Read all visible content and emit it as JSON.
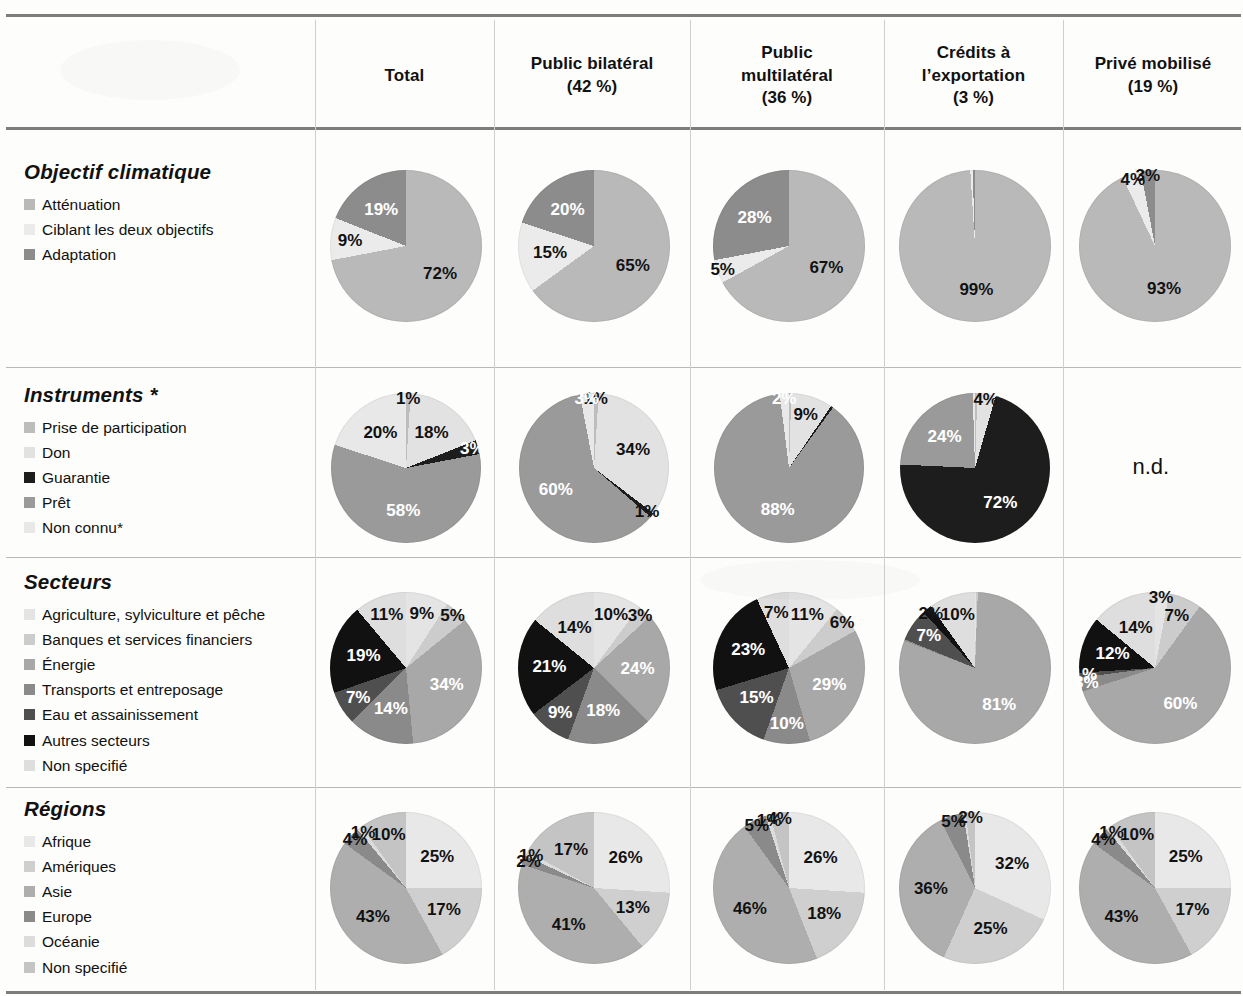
{
  "table": {
    "columns": [
      {
        "id": "rowhead",
        "lines": []
      },
      {
        "id": "total",
        "lines": [
          "Total"
        ]
      },
      {
        "id": "public_bilateral",
        "lines": [
          "Public bilatéral",
          "(42 %)"
        ]
      },
      {
        "id": "public_multilateral",
        "lines": [
          "Public",
          "multilatéral",
          "(36 %)"
        ]
      },
      {
        "id": "credits_export",
        "lines": [
          "Crédits à",
          "l’exportation",
          "(3 %)"
        ]
      },
      {
        "id": "prive_mobilise",
        "lines": [
          "Privé mobilisé",
          "(19 %)"
        ]
      }
    ],
    "not_available_label": "n.d."
  },
  "sections": [
    {
      "id": "objectif-climatique",
      "title": "Objectif climatique",
      "legend": [
        {
          "label": "Atténuation",
          "color": "#b9b9b9"
        },
        {
          "label": "Ciblant les deux objectifs",
          "color": "#ebebeb"
        },
        {
          "label": "Adaptation",
          "color": "#8c8c8c"
        }
      ]
    },
    {
      "id": "instruments",
      "title": "Instruments *",
      "legend": [
        {
          "label": "Prise de participation",
          "color": "#bdbdbd"
        },
        {
          "label": "Don",
          "color": "#e2e2e2"
        },
        {
          "label": "Guarantie",
          "color": "#1d1d1d"
        },
        {
          "label": "Prêt",
          "color": "#9a9a9a"
        },
        {
          "label": "Non connu*",
          "color": "#e8e8e8"
        }
      ]
    },
    {
      "id": "secteurs",
      "title": "Secteurs",
      "legend": [
        {
          "label": "Agriculture, sylviculture et pêche",
          "color": "#e4e4e4"
        },
        {
          "label": "Banques et services financiers",
          "color": "#cccccc"
        },
        {
          "label": "Énergie",
          "color": "#a8a8a8"
        },
        {
          "label": "Transports et entreposage",
          "color": "#8a8a8a"
        },
        {
          "label": "Eau et assainissement",
          "color": "#4f4f4f"
        },
        {
          "label": "Autres secteurs",
          "color": "#111111"
        },
        {
          "label": "Non specifié",
          "color": "#dedede"
        }
      ]
    },
    {
      "id": "regions",
      "title": "Régions",
      "legend": [
        {
          "label": "Afrique",
          "color": "#e8e8e8"
        },
        {
          "label": "Amériques",
          "color": "#cfcfcf"
        },
        {
          "label": "Asie",
          "color": "#aeaeae"
        },
        {
          "label": "Europe",
          "color": "#8a8a8a"
        },
        {
          "label": "Océanie",
          "color": "#dcdcdc"
        },
        {
          "label": "Non specifié",
          "color": "#c4c4c4"
        }
      ]
    }
  ],
  "chart_data": [
    {
      "type": "pie",
      "section": "objectif-climatique",
      "column": "total",
      "title": "Objectif climatique — Total",
      "categories": [
        "Atténuation",
        "Ciblant les deux objectifs",
        "Adaptation"
      ],
      "values": [
        72,
        9,
        19
      ],
      "colors": [
        "#b9b9b9",
        "#ebebeb",
        "#8c8c8c"
      ],
      "labels": [
        "72%",
        "9%",
        "19%"
      ],
      "label_colors": [
        "#111111",
        "#111111",
        "#ffffff"
      ]
    },
    {
      "type": "pie",
      "section": "objectif-climatique",
      "column": "public_bilateral",
      "title": "Objectif climatique — Public bilatéral",
      "categories": [
        "Atténuation",
        "Ciblant les deux objectifs",
        "Adaptation"
      ],
      "values": [
        65,
        15,
        20
      ],
      "colors": [
        "#b9b9b9",
        "#ebebeb",
        "#8c8c8c"
      ],
      "labels": [
        "65%",
        "15%",
        "20%"
      ],
      "label_colors": [
        "#111111",
        "#111111",
        "#ffffff"
      ]
    },
    {
      "type": "pie",
      "section": "objectif-climatique",
      "column": "public_multilateral",
      "title": "Objectif climatique — Public multilatéral",
      "categories": [
        "Atténuation",
        "Ciblant les deux objectifs",
        "Adaptation"
      ],
      "values": [
        67,
        5,
        28
      ],
      "colors": [
        "#b9b9b9",
        "#ebebeb",
        "#8c8c8c"
      ],
      "labels": [
        "67%",
        "5%",
        "28%"
      ],
      "label_colors": [
        "#111111",
        "#111111",
        "#ffffff"
      ]
    },
    {
      "type": "pie",
      "section": "objectif-climatique",
      "column": "credits_export",
      "title": "Objectif climatique — Crédits à l’exportation",
      "categories": [
        "Atténuation",
        "Ciblant les deux objectifs",
        "Adaptation"
      ],
      "values": [
        99,
        0.5,
        0.5
      ],
      "colors": [
        "#b9b9b9",
        "#ebebeb",
        "#8c8c8c"
      ],
      "labels": [
        "99%",
        "",
        ""
      ],
      "label_colors": [
        "#111111",
        "#111111",
        "#ffffff"
      ]
    },
    {
      "type": "pie",
      "section": "objectif-climatique",
      "column": "prive_mobilise",
      "title": "Objectif climatique — Privé mobilisé",
      "categories": [
        "Atténuation",
        "Ciblant les deux objectifs",
        "Adaptation"
      ],
      "values": [
        93,
        4,
        3
      ],
      "colors": [
        "#b9b9b9",
        "#ebebeb",
        "#8c8c8c"
      ],
      "labels": [
        "93%",
        "4%",
        "3%"
      ],
      "label_colors": [
        "#111111",
        "#111111",
        "#111111"
      ]
    },
    {
      "type": "pie",
      "section": "instruments",
      "column": "total",
      "title": "Instruments — Total",
      "categories": [
        "Prise de participation",
        "Don",
        "Guarantie",
        "Prêt",
        "Non connu*"
      ],
      "values": [
        1,
        18,
        3,
        58,
        20
      ],
      "colors": [
        "#bdbdbd",
        "#e2e2e2",
        "#1d1d1d",
        "#9a9a9a",
        "#e8e8e8"
      ],
      "labels": [
        "1%",
        "18%",
        "3%",
        "58%",
        "20%"
      ],
      "label_colors": [
        "#111111",
        "#111111",
        "#ffffff",
        "#ffffff",
        "#111111"
      ]
    },
    {
      "type": "pie",
      "section": "instruments",
      "column": "public_bilateral",
      "title": "Instruments — Public bilatéral",
      "categories": [
        "Prise de participation",
        "Don",
        "Guarantie",
        "Prêt",
        "Non connu*"
      ],
      "values": [
        1,
        34,
        1,
        60,
        3
      ],
      "colors": [
        "#bdbdbd",
        "#e2e2e2",
        "#1d1d1d",
        "#9a9a9a",
        "#e8e8e8"
      ],
      "labels": [
        "1%",
        "34%",
        "1%",
        "60%",
        "3%"
      ],
      "label_colors": [
        "#111111",
        "#111111",
        "#111111",
        "#ffffff",
        "#ffffff"
      ]
    },
    {
      "type": "pie",
      "section": "instruments",
      "column": "public_multilateral",
      "title": "Instruments — Public multilatéral",
      "categories": [
        "Prise de participation",
        "Don",
        "Guarantie",
        "Prêt",
        "Non connu*"
      ],
      "values": [
        0.5,
        9,
        0.5,
        88,
        2
      ],
      "colors": [
        "#bdbdbd",
        "#e2e2e2",
        "#1d1d1d",
        "#9a9a9a",
        "#e8e8e8"
      ],
      "labels": [
        "",
        "9%",
        "",
        "88%",
        "2%"
      ],
      "label_colors": [
        "#111111",
        "#111111",
        "#111111",
        "#ffffff",
        "#ffffff"
      ]
    },
    {
      "type": "pie",
      "section": "instruments",
      "column": "credits_export",
      "title": "Instruments — Crédits à l’exportation",
      "categories": [
        "Prise de participation",
        "Don",
        "Guarantie",
        "Prêt",
        "Non connu*"
      ],
      "values": [
        0.5,
        4,
        72,
        24,
        0.5
      ],
      "colors": [
        "#bdbdbd",
        "#e2e2e2",
        "#1d1d1d",
        "#9a9a9a",
        "#e8e8e8"
      ],
      "labels": [
        "",
        "4%",
        "72%",
        "24%",
        ""
      ],
      "label_colors": [
        "#111111",
        "#111111",
        "#ffffff",
        "#ffffff",
        "#111111"
      ]
    },
    {
      "type": "pie",
      "section": "instruments",
      "column": "prive_mobilise",
      "title": "Instruments — Privé mobilisé",
      "categories": [],
      "values": [],
      "colors": [],
      "labels": [],
      "not_available": "n.d."
    },
    {
      "type": "pie",
      "section": "secteurs",
      "column": "total",
      "title": "Secteurs — Total",
      "categories": [
        "Agriculture, sylviculture et pêche",
        "Banques et services financiers",
        "Énergie",
        "Transports et entreposage",
        "Eau et assainissement",
        "Autres secteurs",
        "Non specifié"
      ],
      "values": [
        9,
        5,
        34,
        14,
        7,
        19,
        11
      ],
      "colors": [
        "#e4e4e4",
        "#cccccc",
        "#a8a8a8",
        "#8a8a8a",
        "#4f4f4f",
        "#111111",
        "#dedede"
      ],
      "labels": [
        "9%",
        "5%",
        "34%",
        "14%",
        "7%",
        "19%",
        "11%"
      ],
      "label_colors": [
        "#111111",
        "#111111",
        "#ffffff",
        "#ffffff",
        "#ffffff",
        "#ffffff",
        "#111111"
      ]
    },
    {
      "type": "pie",
      "section": "secteurs",
      "column": "public_bilateral",
      "title": "Secteurs — Public bilatéral",
      "categories": [
        "Agriculture, sylviculture et pêche",
        "Banques et services financiers",
        "Énergie",
        "Transports et entreposage",
        "Eau et assainissement",
        "Autres secteurs",
        "Non specifié"
      ],
      "values": [
        10,
        3,
        24,
        18,
        9,
        21,
        14
      ],
      "colors": [
        "#e4e4e4",
        "#cccccc",
        "#a8a8a8",
        "#8a8a8a",
        "#4f4f4f",
        "#111111",
        "#dedede"
      ],
      "labels": [
        "10%",
        "3%",
        "24%",
        "18%",
        "9%",
        "21%",
        "14%"
      ],
      "label_colors": [
        "#111111",
        "#111111",
        "#ffffff",
        "#ffffff",
        "#ffffff",
        "#ffffff",
        "#111111"
      ]
    },
    {
      "type": "pie",
      "section": "secteurs",
      "column": "public_multilateral",
      "title": "Secteurs — Public multilatéral",
      "categories": [
        "Agriculture, sylviculture et pêche",
        "Banques et services financiers",
        "Énergie",
        "Transports et entreposage",
        "Eau et assainissement",
        "Autres secteurs",
        "Non specifié"
      ],
      "values": [
        11,
        6,
        29,
        10,
        15,
        23,
        7
      ],
      "colors": [
        "#e4e4e4",
        "#cccccc",
        "#a8a8a8",
        "#8a8a8a",
        "#4f4f4f",
        "#111111",
        "#dedede"
      ],
      "labels": [
        "11%",
        "6%",
        "29%",
        "10%",
        "15%",
        "23%",
        "7%"
      ],
      "label_colors": [
        "#111111",
        "#111111",
        "#ffffff",
        "#ffffff",
        "#ffffff",
        "#ffffff",
        "#111111"
      ]
    },
    {
      "type": "pie",
      "section": "secteurs",
      "column": "credits_export",
      "title": "Secteurs — Crédits à l’exportation",
      "categories": [
        "Agriculture, sylviculture et pêche",
        "Banques et services financiers",
        "Énergie",
        "Transports et entreposage",
        "Eau et assainissement",
        "Autres secteurs",
        "Non specifié"
      ],
      "values": [
        0.3,
        0.3,
        81,
        0.3,
        7,
        2,
        10
      ],
      "colors": [
        "#e4e4e4",
        "#cccccc",
        "#a8a8a8",
        "#8a8a8a",
        "#4f4f4f",
        "#111111",
        "#dedede"
      ],
      "labels": [
        "",
        "",
        "81%",
        "",
        "7%",
        "2%",
        "10%"
      ],
      "label_colors": [
        "#111111",
        "#111111",
        "#ffffff",
        "#ffffff",
        "#ffffff",
        "#111111",
        "#111111"
      ]
    },
    {
      "type": "pie",
      "section": "secteurs",
      "column": "prive_mobilise",
      "title": "Secteurs — Privé mobilisé",
      "categories": [
        "Agriculture, sylviculture et pêche",
        "Banques et services financiers",
        "Énergie",
        "Transports et entreposage",
        "Eau et assainissement",
        "Autres secteurs",
        "Non specifié"
      ],
      "values": [
        3,
        7,
        60,
        3,
        1,
        12,
        14
      ],
      "colors": [
        "#e4e4e4",
        "#cccccc",
        "#a8a8a8",
        "#8a8a8a",
        "#4f4f4f",
        "#111111",
        "#dedede"
      ],
      "labels": [
        "3%",
        "7%",
        "60%",
        "3%",
        "1%",
        "12%",
        "14%"
      ],
      "label_colors": [
        "#111111",
        "#111111",
        "#ffffff",
        "#ffffff",
        "#ffffff",
        "#ffffff",
        "#111111"
      ]
    },
    {
      "type": "pie",
      "section": "regions",
      "column": "total",
      "title": "Régions — Total",
      "categories": [
        "Afrique",
        "Amériques",
        "Asie",
        "Europe",
        "Océanie",
        "Non specifié"
      ],
      "values": [
        25,
        17,
        43,
        4,
        1,
        10
      ],
      "colors": [
        "#e8e8e8",
        "#cfcfcf",
        "#aeaeae",
        "#8a8a8a",
        "#dcdcdc",
        "#c4c4c4"
      ],
      "labels": [
        "25%",
        "17%",
        "43%",
        "4%",
        "1%",
        "10%"
      ],
      "label_colors": [
        "#111111",
        "#111111",
        "#111111",
        "#111111",
        "#111111",
        "#111111"
      ]
    },
    {
      "type": "pie",
      "section": "regions",
      "column": "public_bilateral",
      "title": "Régions — Public bilatéral",
      "categories": [
        "Afrique",
        "Amériques",
        "Asie",
        "Europe",
        "Océanie",
        "Non specifié"
      ],
      "values": [
        26,
        13,
        41,
        2,
        1,
        17
      ],
      "colors": [
        "#e8e8e8",
        "#cfcfcf",
        "#aeaeae",
        "#8a8a8a",
        "#dcdcdc",
        "#c4c4c4"
      ],
      "labels": [
        "26%",
        "13%",
        "41%",
        "2%",
        "1%",
        "17%"
      ],
      "label_colors": [
        "#111111",
        "#111111",
        "#111111",
        "#111111",
        "#111111",
        "#111111"
      ]
    },
    {
      "type": "pie",
      "section": "regions",
      "column": "public_multilateral",
      "title": "Régions — Public multilatéral",
      "categories": [
        "Afrique",
        "Amériques",
        "Asie",
        "Europe",
        "Océanie",
        "Non specifié"
      ],
      "values": [
        26,
        18,
        46,
        5,
        1,
        4
      ],
      "colors": [
        "#e8e8e8",
        "#cfcfcf",
        "#aeaeae",
        "#8a8a8a",
        "#dcdcdc",
        "#c4c4c4"
      ],
      "labels": [
        "26%",
        "18%",
        "46%",
        "5%",
        "1%",
        "4%"
      ],
      "label_colors": [
        "#111111",
        "#111111",
        "#111111",
        "#111111",
        "#111111",
        "#111111"
      ]
    },
    {
      "type": "pie",
      "section": "regions",
      "column": "credits_export",
      "title": "Régions — Crédits à l’exportation",
      "categories": [
        "Afrique",
        "Amériques",
        "Asie",
        "Europe",
        "Océanie",
        "Non specifié"
      ],
      "values": [
        32,
        25,
        36,
        5,
        0.5,
        2
      ],
      "colors": [
        "#e8e8e8",
        "#cfcfcf",
        "#aeaeae",
        "#8a8a8a",
        "#dcdcdc",
        "#c4c4c4"
      ],
      "labels": [
        "32%",
        "25%",
        "36%",
        "5%",
        "",
        "2%"
      ],
      "label_colors": [
        "#111111",
        "#111111",
        "#111111",
        "#111111",
        "#111111",
        "#111111"
      ]
    },
    {
      "type": "pie",
      "section": "regions",
      "column": "prive_mobilise",
      "title": "Régions — Privé mobilisé",
      "categories": [
        "Afrique",
        "Amériques",
        "Asie",
        "Europe",
        "Océanie",
        "Non specifié"
      ],
      "values": [
        25,
        17,
        43,
        4,
        1,
        10
      ],
      "colors": [
        "#e8e8e8",
        "#cfcfcf",
        "#aeaeae",
        "#8a8a8a",
        "#dcdcdc",
        "#c4c4c4"
      ],
      "labels": [
        "25%",
        "17%",
        "43%",
        "4%",
        "1%",
        "10%"
      ],
      "label_colors": [
        "#111111",
        "#111111",
        "#111111",
        "#111111",
        "#111111",
        "#111111"
      ]
    }
  ]
}
